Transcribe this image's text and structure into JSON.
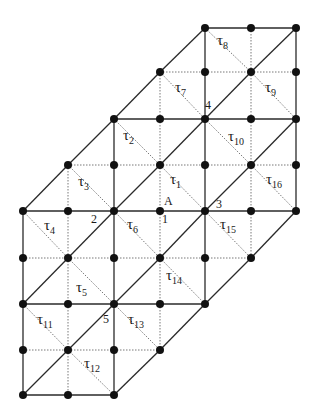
{
  "figure": {
    "colors": {
      "line": "#2a2a2a",
      "dotted": "#6a6a6a",
      "node": "#111111",
      "background": "#ffffff"
    }
  },
  "grid": {
    "cols_x": [
      23,
      68,
      114,
      160,
      205,
      251,
      296
    ],
    "rows_y": [
      28,
      72,
      119,
      165,
      211,
      258,
      304,
      350,
      395
    ],
    "rows": [
      {
        "row": 0,
        "cols": [
          4,
          5,
          6
        ]
      },
      {
        "row": 1,
        "cols": [
          3,
          4,
          5,
          6
        ]
      },
      {
        "row": 2,
        "cols": [
          2,
          3,
          4,
          5,
          6
        ]
      },
      {
        "row": 3,
        "cols": [
          1,
          2,
          3,
          4,
          5,
          6
        ]
      },
      {
        "row": 4,
        "cols": [
          0,
          1,
          2,
          3,
          4,
          5,
          6
        ]
      },
      {
        "row": 5,
        "cols": [
          0,
          1,
          2,
          3,
          4,
          5
        ]
      },
      {
        "row": 6,
        "cols": [
          0,
          1,
          2,
          3,
          4
        ]
      },
      {
        "row": 7,
        "cols": [
          0,
          1,
          2,
          3
        ]
      },
      {
        "row": 8,
        "cols": [
          0,
          1,
          2
        ]
      }
    ]
  },
  "triangle_labels": [
    {
      "symbol": "τ",
      "index": "1",
      "x": 170,
      "y": 172
    },
    {
      "symbol": "τ",
      "index": "2",
      "x": 123,
      "y": 128
    },
    {
      "symbol": "τ",
      "index": "3",
      "x": 78,
      "y": 174
    },
    {
      "symbol": "τ",
      "index": "4",
      "x": 44,
      "y": 218
    },
    {
      "symbol": "τ",
      "index": "5",
      "x": 76,
      "y": 280
    },
    {
      "symbol": "τ",
      "index": "6",
      "x": 127,
      "y": 217
    },
    {
      "symbol": "τ",
      "index": "7",
      "x": 175,
      "y": 80
    },
    {
      "symbol": "τ",
      "index": "8",
      "x": 217,
      "y": 33
    },
    {
      "symbol": "τ",
      "index": "9",
      "x": 265,
      "y": 80
    },
    {
      "symbol": "τ",
      "index": "10",
      "x": 228,
      "y": 129
    },
    {
      "symbol": "τ",
      "index": "11",
      "x": 37,
      "y": 312
    },
    {
      "symbol": "τ",
      "index": "12",
      "x": 84,
      "y": 356
    },
    {
      "symbol": "τ",
      "index": "13",
      "x": 128,
      "y": 312
    },
    {
      "symbol": "τ",
      "index": "14",
      "x": 166,
      "y": 268
    },
    {
      "symbol": "τ",
      "index": "15",
      "x": 220,
      "y": 217
    },
    {
      "symbol": "τ",
      "index": "16",
      "x": 266,
      "y": 172
    }
  ],
  "point_labels": [
    {
      "text": "A",
      "x": 164,
      "y": 195
    },
    {
      "text": "1",
      "x": 162,
      "y": 213
    },
    {
      "text": "2",
      "x": 91,
      "y": 213
    },
    {
      "text": "3",
      "x": 216,
      "y": 198
    },
    {
      "text": "4",
      "x": 205,
      "y": 99
    },
    {
      "text": "5",
      "x": 103,
      "y": 313
    }
  ]
}
